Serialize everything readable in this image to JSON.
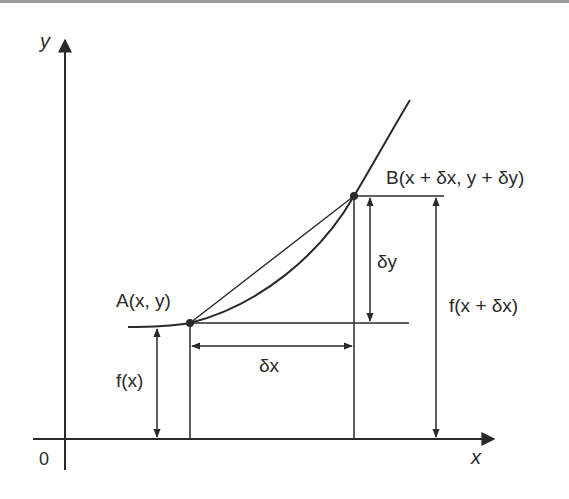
{
  "diagram": {
    "axes": {
      "x_label": "x",
      "y_label": "y",
      "origin_label": "0"
    },
    "points": {
      "A": {
        "label": "A(x, y)"
      },
      "B": {
        "label": "B(x + δx, y + δy)"
      }
    },
    "dimensions": {
      "dx": "δx",
      "dy": "δy",
      "fx": "f(x)",
      "fxdx": "f(x + δx)"
    },
    "colors": {
      "line": "#2a2a2a",
      "background": "#ffffff",
      "top_border": "#9a9a9a"
    }
  }
}
